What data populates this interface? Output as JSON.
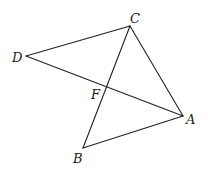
{
  "diagram": {
    "type": "geometry",
    "points": {
      "A": {
        "label": "A",
        "x": 183,
        "y": 116,
        "lx": 186,
        "ly": 124
      },
      "B": {
        "label": "B",
        "x": 83,
        "y": 148,
        "lx": 73,
        "ly": 163
      },
      "C": {
        "label": "C",
        "x": 130,
        "y": 26,
        "lx": 130,
        "ly": 23
      },
      "D": {
        "label": "D",
        "x": 26,
        "y": 56,
        "lx": 12,
        "ly": 62
      },
      "F": {
        "label": "F",
        "x": 106,
        "y": 87,
        "lx": 91,
        "ly": 99
      }
    },
    "segments": [
      [
        "D",
        "C"
      ],
      [
        "D",
        "A"
      ],
      [
        "C",
        "A"
      ],
      [
        "C",
        "B"
      ],
      [
        "B",
        "A"
      ]
    ],
    "stroke_color": "#222222"
  }
}
